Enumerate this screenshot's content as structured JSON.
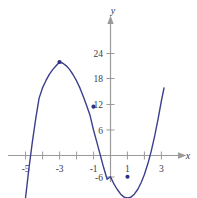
{
  "figure": {
    "background_color": "#ffffff",
    "curve_color": "#3b3f8c",
    "axis_color": "#9a9a9a",
    "text_color": "#3b3b4a",
    "point_color": "#2e3180"
  },
  "axes": {
    "x_label": "x",
    "y_label": "y",
    "x_ticks": [
      {
        "value": -5,
        "label": "-5"
      },
      {
        "value": -4,
        "label": ""
      },
      {
        "value": -3,
        "label": "-3"
      },
      {
        "value": -2,
        "label": ""
      },
      {
        "value": -1,
        "label": "-1"
      },
      {
        "value": 1,
        "label": "1"
      },
      {
        "value": 2,
        "label": ""
      },
      {
        "value": 3,
        "label": "3"
      }
    ],
    "y_ticks": [
      {
        "value": 24,
        "label": "24"
      },
      {
        "value": 18,
        "label": "18"
      },
      {
        "value": 12,
        "label": "12"
      },
      {
        "value": 6,
        "label": "6"
      },
      {
        "value": -6,
        "label": "-6"
      }
    ]
  },
  "chart_data": {
    "type": "line",
    "title": "",
    "xlabel": "x",
    "ylabel": "y",
    "xlim": [
      -5.6,
      3.4
    ],
    "ylim": [
      -9,
      29
    ],
    "grid": false,
    "legend": "none",
    "series": [
      {
        "name": "cubic",
        "equation": "y = x^3 + 3x^2 - 9x - 5",
        "x": [
          -5.55,
          -5.4,
          -5.2,
          -5.0,
          -4.8,
          -4.6,
          -4.4,
          -4.2,
          -4.0,
          -3.8,
          -3.6,
          -3.4,
          -3.2,
          -3.0,
          -2.8,
          -2.6,
          -2.4,
          -2.2,
          -2.0,
          -1.8,
          -1.6,
          -1.4,
          -1.2,
          -1.0,
          -0.8,
          -0.6,
          -0.4,
          -0.2,
          0.0,
          0.2,
          0.4,
          0.6,
          0.8,
          1.0,
          1.2,
          1.4,
          1.6,
          1.8,
          2.0,
          2.2,
          2.4,
          2.6,
          2.8,
          3.0,
          3.15
        ],
        "y": [
          -33.7,
          -26.0,
          -17.6,
          -10.0,
          -3.1,
          3.1,
          8.6,
          13.5,
          15.9,
          17.6,
          19.1,
          20.2,
          21.1,
          22.0,
          21.7,
          21.1,
          20.2,
          19.0,
          17.6,
          15.9,
          13.9,
          11.7,
          9.4,
          6.0,
          3.1,
          0.1,
          -2.9,
          -5.6,
          -5.0,
          -6.7,
          -8.0,
          -9.1,
          -9.8,
          -10.0,
          -9.8,
          -9.1,
          -8.0,
          -6.4,
          -4.4,
          -1.9,
          1.1,
          4.6,
          8.6,
          13.0,
          15.9
        ]
      }
    ],
    "marked_points": [
      {
        "x": -3,
        "y": 22,
        "label": "local-maximum"
      },
      {
        "x": -1,
        "y": 11.5,
        "label": "point-on-curve"
      },
      {
        "x": 1,
        "y": -5,
        "label": "local-minimum"
      }
    ]
  }
}
